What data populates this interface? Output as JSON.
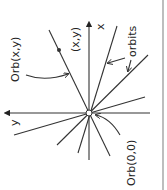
{
  "diagram": {
    "labels": {
      "orb_xy": "Orb(x,y)",
      "point_xy": "(x,y)",
      "x_axis": "x",
      "y_axis": "y",
      "orbits": "orbits",
      "orb_00": "Orb(0,0)"
    },
    "colors": {
      "ink": "#333333",
      "background": "#ffffff"
    }
  }
}
